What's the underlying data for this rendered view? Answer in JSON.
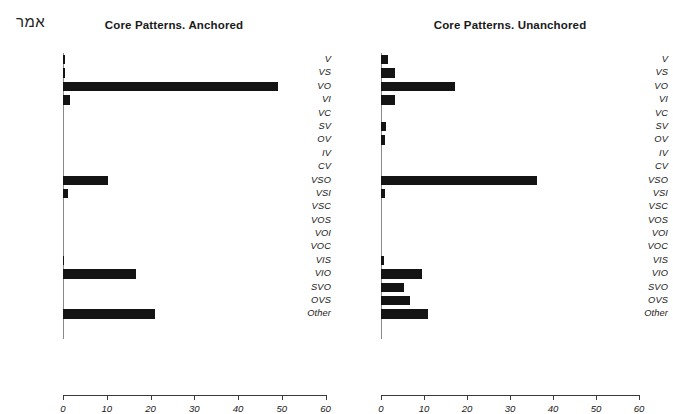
{
  "figure": {
    "corner_label": "אמר",
    "background_color": "#ffffff",
    "bar_color": "#141414"
  },
  "panels": {
    "left": {
      "title": "Core Patterns. Anchored"
    },
    "right": {
      "title": "Core Patterns. Unanchored"
    }
  },
  "axis": {
    "tick_labels": [
      "0",
      "10",
      "20",
      "30",
      "40",
      "50",
      "60"
    ],
    "tick_values": [
      0,
      10,
      20,
      30,
      40,
      50,
      60
    ],
    "min": 0,
    "max": 60
  },
  "chart_data": [
    {
      "type": "bar",
      "orientation": "horizontal",
      "title": "Core Patterns. Anchored",
      "xlabel": "",
      "ylabel": "",
      "xlim": [
        0,
        60
      ],
      "grid": false,
      "legend": "none",
      "categories": [
        "V",
        "VS",
        "VO",
        "VI",
        "VC",
        "SV",
        "OV",
        "IV",
        "CV",
        "VSO",
        "VSI",
        "VSC",
        "VOS",
        "VOI",
        "VOC",
        "VIS",
        "VIO",
        "SVO",
        "OVS",
        "Other"
      ],
      "values": [
        0.5,
        0.5,
        49.2,
        1.5,
        0,
        0,
        0,
        0,
        0,
        10.3,
        1.2,
        0,
        0,
        0,
        0,
        0.3,
        16.7,
        0,
        0,
        21.0
      ]
    },
    {
      "type": "bar",
      "orientation": "horizontal",
      "title": "Core Patterns. Unanchored",
      "xlabel": "",
      "ylabel": "",
      "xlim": [
        0,
        60
      ],
      "grid": false,
      "legend": "none",
      "categories": [
        "V",
        "VS",
        "VO",
        "VI",
        "VC",
        "SV",
        "OV",
        "IV",
        "CV",
        "VSO",
        "VSI",
        "VSC",
        "VOS",
        "VOI",
        "VOC",
        "VIS",
        "VIO",
        "SVO",
        "OVS",
        "Other"
      ],
      "values": [
        1.7,
        3.3,
        17.3,
        3.3,
        0,
        1.2,
        1.0,
        0,
        0,
        36.2,
        0.9,
        0,
        0,
        0,
        0,
        0.8,
        9.6,
        5.4,
        6.8,
        11.0
      ]
    }
  ]
}
